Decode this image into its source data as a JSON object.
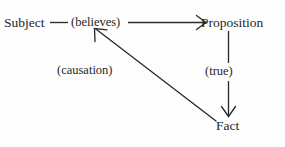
{
  "diagram": {
    "type": "node-link-diagram",
    "background_color": "#fefefe",
    "stroke_color": "#2b2b2b",
    "text_color": "#1f1f1f",
    "nodes": [
      {
        "id": "subject",
        "label": "Subject",
        "x": 33,
        "y": 23
      },
      {
        "id": "proposition",
        "label": "Proposition",
        "x": 240,
        "y": 23
      },
      {
        "id": "fact",
        "label": "Fact",
        "x": 231,
        "y": 126
      }
    ],
    "edges": [
      {
        "id": "subject-to-proposition",
        "label": "(believes)",
        "from": "subject",
        "to": "proposition",
        "arrowhead": "open-v",
        "direction": "right"
      },
      {
        "id": "proposition-to-fact",
        "label": "(true)",
        "from": "proposition",
        "to": "fact",
        "arrowhead": "open-v",
        "direction": "down"
      },
      {
        "id": "fact-to-subject",
        "label": "(causation)",
        "from": "fact",
        "to": "subject",
        "arrowhead": "open-v",
        "direction": "up-left"
      }
    ]
  }
}
